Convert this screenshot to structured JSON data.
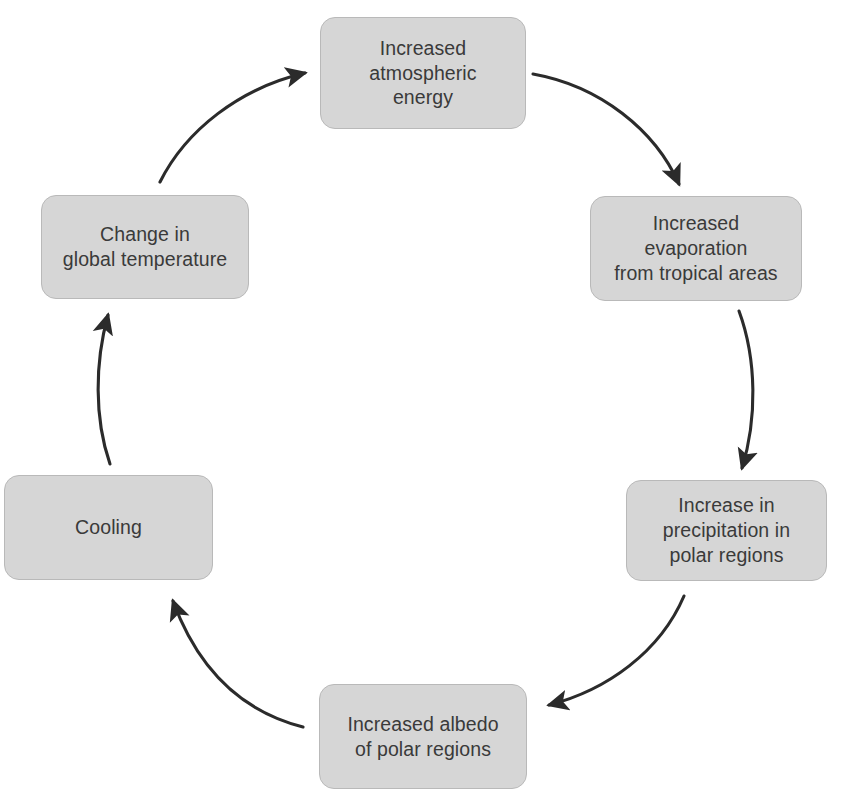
{
  "diagram": {
    "type": "circular-flow",
    "direction": "clockwise",
    "background_color": "#ffffff",
    "node_fill_color": "#d6d6d6",
    "node_border_color": "#b9b9b9",
    "node_text_color": "#3a3a3a",
    "arrow_color": "#2b2b2b",
    "nodes": [
      {
        "id": "atmospheric-energy",
        "label": "Increased\natmospheric\nenergy",
        "position": "top"
      },
      {
        "id": "evaporation",
        "label": "Increased\nevaporation\nfrom tropical areas",
        "position": "upper-right"
      },
      {
        "id": "precipitation",
        "label": "Increase in\nprecipitation in\npolar regions",
        "position": "lower-right"
      },
      {
        "id": "albedo",
        "label": "Increased albedo\nof polar regions",
        "position": "bottom"
      },
      {
        "id": "cooling",
        "label": "Cooling",
        "position": "lower-left"
      },
      {
        "id": "temperature",
        "label": "Change in\nglobal temperature",
        "position": "upper-left"
      }
    ],
    "edges": [
      {
        "id": "edge-energy-to-evaporation",
        "from": "atmospheric-energy",
        "to": "evaporation"
      },
      {
        "id": "edge-evaporation-to-precipitation",
        "from": "evaporation",
        "to": "precipitation"
      },
      {
        "id": "edge-precipitation-to-albedo",
        "from": "precipitation",
        "to": "albedo"
      },
      {
        "id": "edge-albedo-to-cooling",
        "from": "albedo",
        "to": "cooling"
      },
      {
        "id": "edge-cooling-to-temperature",
        "from": "cooling",
        "to": "temperature"
      },
      {
        "id": "edge-temperature-to-energy",
        "from": "temperature",
        "to": "atmospheric-energy"
      }
    ]
  }
}
